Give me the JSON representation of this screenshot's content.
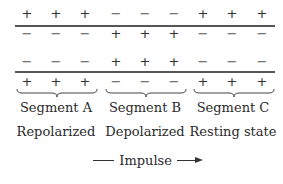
{
  "diagram": {
    "columns_x": [
      27,
      56,
      85,
      116,
      145,
      174,
      203,
      232,
      262
    ],
    "rows": [
      {
        "y": 7,
        "signs": [
          "+",
          "+",
          "+",
          "−",
          "−",
          "−",
          "+",
          "+",
          "+"
        ]
      },
      {
        "y": 27,
        "signs": [
          "−",
          "−",
          "−",
          "+",
          "+",
          "+",
          "−",
          "−",
          "−"
        ]
      },
      {
        "y": 55,
        "signs": [
          "−",
          "−",
          "−",
          "+",
          "+",
          "+",
          "−",
          "−",
          "−"
        ]
      },
      {
        "y": 75,
        "signs": [
          "+",
          "+",
          "+",
          "−",
          "−",
          "−",
          "+",
          "+",
          "+"
        ]
      }
    ],
    "membrane_lines_y": [
      25,
      71
    ],
    "segments": [
      {
        "name": "Segment A",
        "state": "Repolarized",
        "center_x": 56
      },
      {
        "name": "Segment B",
        "state": "Depolarized",
        "center_x": 145
      },
      {
        "name": "Segment C",
        "state": "Resting state",
        "center_x": 233
      }
    ],
    "impulse_label": "Impulse",
    "colors": {
      "ink": "#333333",
      "line": "#555555"
    }
  }
}
